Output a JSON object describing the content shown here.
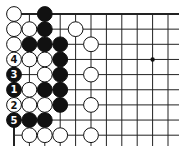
{
  "diagram": {
    "type": "go-board-corner",
    "corner": "top-left",
    "background": "#ffffff",
    "line_color": "#222222",
    "origin": {
      "x": 14,
      "y": 14
    },
    "spacing": {
      "x": 15.4,
      "y": 15.15
    },
    "columns": 11,
    "rows": 9,
    "line_extent": {
      "right": 179,
      "bottom": 146
    },
    "star_points": [
      {
        "col": 9,
        "row": 3
      }
    ],
    "stones": [
      {
        "col": 0,
        "row": 0,
        "color": "white"
      },
      {
        "col": 2,
        "row": 0,
        "color": "black"
      },
      {
        "col": 0,
        "row": 1,
        "color": "white"
      },
      {
        "col": 1,
        "row": 1,
        "color": "white"
      },
      {
        "col": 2,
        "row": 1,
        "color": "black"
      },
      {
        "col": 4,
        "row": 1,
        "color": "white"
      },
      {
        "col": 0,
        "row": 2,
        "color": "white"
      },
      {
        "col": 1,
        "row": 2,
        "color": "black"
      },
      {
        "col": 2,
        "row": 2,
        "color": "black"
      },
      {
        "col": 3,
        "row": 2,
        "color": "black"
      },
      {
        "col": 5,
        "row": 2,
        "color": "white"
      },
      {
        "col": 0,
        "row": 3,
        "color": "white",
        "label": "4"
      },
      {
        "col": 1,
        "row": 3,
        "color": "white"
      },
      {
        "col": 2,
        "row": 3,
        "color": "white"
      },
      {
        "col": 3,
        "row": 3,
        "color": "black"
      },
      {
        "col": 0,
        "row": 4,
        "color": "black",
        "label": "3"
      },
      {
        "col": 2,
        "row": 4,
        "color": "white"
      },
      {
        "col": 3,
        "row": 4,
        "color": "black"
      },
      {
        "col": 5,
        "row": 4,
        "color": "white"
      },
      {
        "col": 0,
        "row": 5,
        "color": "black",
        "label": "1"
      },
      {
        "col": 1,
        "row": 5,
        "color": "white"
      },
      {
        "col": 2,
        "row": 5,
        "color": "black"
      },
      {
        "col": 3,
        "row": 5,
        "color": "black"
      },
      {
        "col": 0,
        "row": 6,
        "color": "white",
        "label": "2"
      },
      {
        "col": 1,
        "row": 6,
        "color": "white"
      },
      {
        "col": 2,
        "row": 6,
        "color": "white"
      },
      {
        "col": 3,
        "row": 6,
        "color": "black"
      },
      {
        "col": 5,
        "row": 6,
        "color": "white"
      },
      {
        "col": 0,
        "row": 7,
        "color": "black",
        "label": "5"
      },
      {
        "col": 1,
        "row": 7,
        "color": "black"
      },
      {
        "col": 2,
        "row": 7,
        "color": "black"
      },
      {
        "col": 1,
        "row": 8,
        "color": "white"
      },
      {
        "col": 2,
        "row": 8,
        "color": "white"
      },
      {
        "col": 3,
        "row": 8,
        "color": "white"
      },
      {
        "col": 5,
        "row": 8,
        "color": "white"
      }
    ],
    "move_sequence": [
      {
        "move": 1,
        "color": "black",
        "col": 0,
        "row": 5
      },
      {
        "move": 2,
        "color": "white",
        "col": 0,
        "row": 6
      },
      {
        "move": 3,
        "color": "black",
        "col": 0,
        "row": 4
      },
      {
        "move": 4,
        "color": "white",
        "col": 0,
        "row": 3
      },
      {
        "move": 5,
        "color": "black",
        "col": 0,
        "row": 7
      }
    ]
  }
}
